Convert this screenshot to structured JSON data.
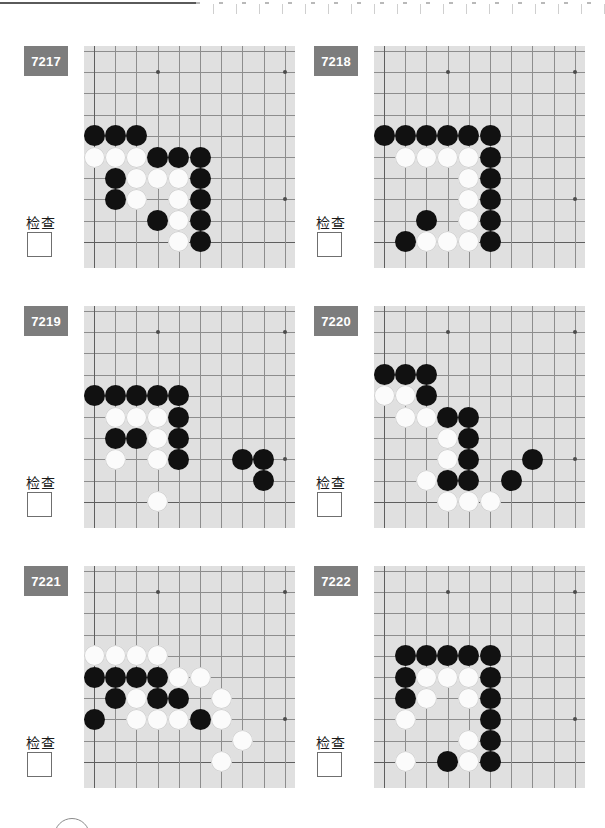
{
  "page": {
    "width": 605,
    "height": 828,
    "background": "#ffffff",
    "top_rule_color": "#5a5a5a",
    "badge_color": "#7d7d7d",
    "board_color": "#e0e0e0",
    "grid_color": "#8d8d8d",
    "black_stone_color": "#111111",
    "white_stone_color": "#fbfbfb"
  },
  "check_label": "检查",
  "board_spec": {
    "cols": 10,
    "rows": 10,
    "cell": 21.2,
    "origin_x": 10,
    "origin_y": 5,
    "star_points": [
      [
        3,
        1
      ],
      [
        9,
        1
      ],
      [
        9,
        7
      ]
    ]
  },
  "panels": [
    {
      "id": "7217",
      "check_label": "检查",
      "stones": [
        {
          "c": 0,
          "r": 4,
          "color": "b"
        },
        {
          "c": 1,
          "r": 4,
          "color": "b"
        },
        {
          "c": 2,
          "r": 4,
          "color": "b"
        },
        {
          "c": 0,
          "r": 5,
          "color": "w"
        },
        {
          "c": 1,
          "r": 5,
          "color": "w"
        },
        {
          "c": 2,
          "r": 5,
          "color": "w"
        },
        {
          "c": 3,
          "r": 5,
          "color": "b"
        },
        {
          "c": 4,
          "r": 5,
          "color": "b"
        },
        {
          "c": 5,
          "r": 5,
          "color": "b"
        },
        {
          "c": 1,
          "r": 6,
          "color": "b"
        },
        {
          "c": 2,
          "r": 6,
          "color": "w"
        },
        {
          "c": 3,
          "r": 6,
          "color": "w"
        },
        {
          "c": 4,
          "r": 6,
          "color": "w"
        },
        {
          "c": 5,
          "r": 6,
          "color": "b"
        },
        {
          "c": 1,
          "r": 7,
          "color": "b"
        },
        {
          "c": 2,
          "r": 7,
          "color": "w"
        },
        {
          "c": 4,
          "r": 7,
          "color": "w"
        },
        {
          "c": 5,
          "r": 7,
          "color": "b"
        },
        {
          "c": 3,
          "r": 8,
          "color": "b"
        },
        {
          "c": 4,
          "r": 8,
          "color": "w"
        },
        {
          "c": 5,
          "r": 8,
          "color": "b"
        },
        {
          "c": 4,
          "r": 9,
          "color": "w"
        },
        {
          "c": 5,
          "r": 9,
          "color": "b"
        }
      ]
    },
    {
      "id": "7218",
      "check_label": "检查",
      "stones": [
        {
          "c": 0,
          "r": 4,
          "color": "b"
        },
        {
          "c": 1,
          "r": 4,
          "color": "b"
        },
        {
          "c": 2,
          "r": 4,
          "color": "b"
        },
        {
          "c": 3,
          "r": 4,
          "color": "b"
        },
        {
          "c": 4,
          "r": 4,
          "color": "b"
        },
        {
          "c": 5,
          "r": 4,
          "color": "b"
        },
        {
          "c": 1,
          "r": 5,
          "color": "w"
        },
        {
          "c": 2,
          "r": 5,
          "color": "w"
        },
        {
          "c": 3,
          "r": 5,
          "color": "w"
        },
        {
          "c": 4,
          "r": 5,
          "color": "w"
        },
        {
          "c": 5,
          "r": 5,
          "color": "b"
        },
        {
          "c": -1,
          "r": 6,
          "color": "w"
        },
        {
          "c": 4,
          "r": 6,
          "color": "w"
        },
        {
          "c": 5,
          "r": 6,
          "color": "b"
        },
        {
          "c": 4,
          "r": 7,
          "color": "w"
        },
        {
          "c": 5,
          "r": 7,
          "color": "b"
        },
        {
          "c": 2,
          "r": 8,
          "color": "b"
        },
        {
          "c": 4,
          "r": 8,
          "color": "w"
        },
        {
          "c": 5,
          "r": 8,
          "color": "b"
        },
        {
          "c": 1,
          "r": 9,
          "color": "b"
        },
        {
          "c": 2,
          "r": 9,
          "color": "w"
        },
        {
          "c": 3,
          "r": 9,
          "color": "w"
        },
        {
          "c": 4,
          "r": 9,
          "color": "w"
        },
        {
          "c": 5,
          "r": 9,
          "color": "b"
        }
      ]
    },
    {
      "id": "7219",
      "check_label": "检查",
      "stones": [
        {
          "c": 0,
          "r": 4,
          "color": "b"
        },
        {
          "c": 1,
          "r": 4,
          "color": "b"
        },
        {
          "c": 2,
          "r": 4,
          "color": "b"
        },
        {
          "c": 3,
          "r": 4,
          "color": "b"
        },
        {
          "c": 4,
          "r": 4,
          "color": "b"
        },
        {
          "c": 1,
          "r": 5,
          "color": "w"
        },
        {
          "c": 2,
          "r": 5,
          "color": "w"
        },
        {
          "c": 3,
          "r": 5,
          "color": "w"
        },
        {
          "c": 4,
          "r": 5,
          "color": "b"
        },
        {
          "c": 1,
          "r": 6,
          "color": "b"
        },
        {
          "c": 2,
          "r": 6,
          "color": "b"
        },
        {
          "c": 3,
          "r": 6,
          "color": "w"
        },
        {
          "c": 4,
          "r": 6,
          "color": "b"
        },
        {
          "c": 1,
          "r": 7,
          "color": "w"
        },
        {
          "c": 3,
          "r": 7,
          "color": "w"
        },
        {
          "c": 4,
          "r": 7,
          "color": "b"
        },
        {
          "c": 7,
          "r": 7,
          "color": "b"
        },
        {
          "c": 8,
          "r": 7,
          "color": "b"
        },
        {
          "c": 8,
          "r": 8,
          "color": "b"
        },
        {
          "c": 3,
          "r": 9,
          "color": "w"
        }
      ]
    },
    {
      "id": "7220",
      "check_label": "检查",
      "stones": [
        {
          "c": 0,
          "r": 3,
          "color": "b"
        },
        {
          "c": 1,
          "r": 3,
          "color": "b"
        },
        {
          "c": 2,
          "r": 3,
          "color": "b"
        },
        {
          "c": 0,
          "r": 4,
          "color": "w"
        },
        {
          "c": 1,
          "r": 4,
          "color": "w"
        },
        {
          "c": 2,
          "r": 4,
          "color": "b"
        },
        {
          "c": 1,
          "r": 5,
          "color": "w"
        },
        {
          "c": 2,
          "r": 5,
          "color": "w"
        },
        {
          "c": 3,
          "r": 5,
          "color": "b"
        },
        {
          "c": 4,
          "r": 5,
          "color": "b"
        },
        {
          "c": -1,
          "r": 6,
          "color": "b"
        },
        {
          "c": 3,
          "r": 6,
          "color": "w"
        },
        {
          "c": 4,
          "r": 6,
          "color": "b"
        },
        {
          "c": 3,
          "r": 7,
          "color": "w"
        },
        {
          "c": 4,
          "r": 7,
          "color": "b"
        },
        {
          "c": 7,
          "r": 7,
          "color": "b"
        },
        {
          "c": -1,
          "r": 8,
          "color": "w"
        },
        {
          "c": 2,
          "r": 8,
          "color": "w"
        },
        {
          "c": 3,
          "r": 8,
          "color": "b"
        },
        {
          "c": 4,
          "r": 8,
          "color": "b"
        },
        {
          "c": 6,
          "r": 8,
          "color": "b"
        },
        {
          "c": 3,
          "r": 9,
          "color": "w"
        },
        {
          "c": 4,
          "r": 9,
          "color": "w"
        },
        {
          "c": 5,
          "r": 9,
          "color": "w"
        }
      ]
    },
    {
      "id": "7221",
      "check_label": "检查",
      "stones": [
        {
          "c": 0,
          "r": 4,
          "color": "w"
        },
        {
          "c": 1,
          "r": 4,
          "color": "w"
        },
        {
          "c": 2,
          "r": 4,
          "color": "w"
        },
        {
          "c": 3,
          "r": 4,
          "color": "w"
        },
        {
          "c": 0,
          "r": 5,
          "color": "b"
        },
        {
          "c": 1,
          "r": 5,
          "color": "b"
        },
        {
          "c": 2,
          "r": 5,
          "color": "b"
        },
        {
          "c": 3,
          "r": 5,
          "color": "b"
        },
        {
          "c": 4,
          "r": 5,
          "color": "w"
        },
        {
          "c": 5,
          "r": 5,
          "color": "w"
        },
        {
          "c": 1,
          "r": 6,
          "color": "b"
        },
        {
          "c": 2,
          "r": 6,
          "color": "w"
        },
        {
          "c": 3,
          "r": 6,
          "color": "b"
        },
        {
          "c": 4,
          "r": 6,
          "color": "b"
        },
        {
          "c": 6,
          "r": 6,
          "color": "w"
        },
        {
          "c": 0,
          "r": 7,
          "color": "b"
        },
        {
          "c": 2,
          "r": 7,
          "color": "w"
        },
        {
          "c": 3,
          "r": 7,
          "color": "w"
        },
        {
          "c": 4,
          "r": 7,
          "color": "w"
        },
        {
          "c": 5,
          "r": 7,
          "color": "b"
        },
        {
          "c": 6,
          "r": 7,
          "color": "w"
        },
        {
          "c": 7,
          "r": 8,
          "color": "w"
        },
        {
          "c": 6,
          "r": 9,
          "color": "w"
        }
      ]
    },
    {
      "id": "7222",
      "check_label": "检查",
      "stones": [
        {
          "c": 1,
          "r": 4,
          "color": "b"
        },
        {
          "c": 2,
          "r": 4,
          "color": "b"
        },
        {
          "c": 3,
          "r": 4,
          "color": "b"
        },
        {
          "c": 4,
          "r": 4,
          "color": "b"
        },
        {
          "c": 5,
          "r": 4,
          "color": "b"
        },
        {
          "c": 1,
          "r": 5,
          "color": "b"
        },
        {
          "c": 2,
          "r": 5,
          "color": "w"
        },
        {
          "c": 3,
          "r": 5,
          "color": "w"
        },
        {
          "c": 4,
          "r": 5,
          "color": "w"
        },
        {
          "c": 5,
          "r": 5,
          "color": "b"
        },
        {
          "c": 1,
          "r": 6,
          "color": "b"
        },
        {
          "c": 2,
          "r": 6,
          "color": "w"
        },
        {
          "c": 4,
          "r": 6,
          "color": "w"
        },
        {
          "c": 5,
          "r": 6,
          "color": "b"
        },
        {
          "c": 1,
          "r": 7,
          "color": "w"
        },
        {
          "c": 5,
          "r": 7,
          "color": "b"
        },
        {
          "c": 4,
          "r": 8,
          "color": "w"
        },
        {
          "c": 5,
          "r": 8,
          "color": "b"
        },
        {
          "c": 1,
          "r": 9,
          "color": "w"
        },
        {
          "c": 3,
          "r": 9,
          "color": "b"
        },
        {
          "c": 4,
          "r": 9,
          "color": "w"
        },
        {
          "c": 5,
          "r": 9,
          "color": "b"
        }
      ]
    }
  ]
}
